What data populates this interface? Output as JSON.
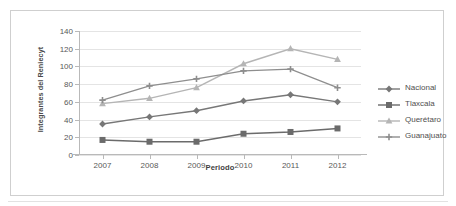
{
  "figure": {
    "caption_remnant": "",
    "y_axis_title": "Integrantes del Reniecyt",
    "x_axis_title": "Periodo"
  },
  "legend": {
    "position": "right",
    "items": [
      {
        "label": "Nacional",
        "marker": "diamond-marker-icon",
        "color": "#777777"
      },
      {
        "label": "Tlaxcala",
        "marker": "square-marker-icon",
        "color": "#6b6b6b"
      },
      {
        "label": "Querétaro",
        "marker": "triangle-marker-icon",
        "color": "#b5b5b5"
      },
      {
        "label": "Guanajuato",
        "marker": "cross-marker-icon",
        "color": "#8e8e8e"
      }
    ]
  },
  "chart_data": {
    "type": "line",
    "title": "",
    "xlabel": "Periodo",
    "ylabel": "Integrantes del Reniecyt",
    "categories": [
      "2007",
      "2008",
      "2009",
      "2010",
      "2011",
      "2012"
    ],
    "x": [
      2007,
      2008,
      2009,
      2010,
      2011,
      2012
    ],
    "ylim": [
      0,
      140
    ],
    "yticks": [
      0,
      20,
      40,
      60,
      80,
      100,
      120,
      140
    ],
    "ytick_labels": [
      "0",
      "20",
      "40",
      "60",
      "80",
      "100",
      "120",
      "140"
    ],
    "grid": true,
    "legend_position": "right",
    "series": [
      {
        "name": "Nacional",
        "values": [
          35,
          43,
          50,
          61,
          68,
          60
        ],
        "color": "#777777",
        "marker": "diamond"
      },
      {
        "name": "Tlaxcala",
        "values": [
          17,
          15,
          15,
          24,
          26,
          30
        ],
        "color": "#6b6b6b",
        "marker": "square"
      },
      {
        "name": "Querétaro",
        "values": [
          58,
          64,
          76,
          103,
          120,
          108
        ],
        "color": "#b5b5b5",
        "marker": "triangle"
      },
      {
        "name": "Guanajuato",
        "values": [
          62,
          78,
          86,
          95,
          97,
          76
        ],
        "color": "#8e8e8e",
        "marker": "cross"
      }
    ]
  }
}
